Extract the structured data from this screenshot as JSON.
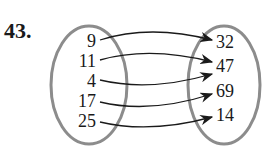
{
  "problem_number": "43.",
  "domain_set": [
    "9",
    "11",
    "4",
    "17",
    "25"
  ],
  "range_set": [
    "32",
    "47",
    "69",
    "14"
  ],
  "mappings": [
    {
      "from": "9",
      "to": "32"
    },
    {
      "from": "11",
      "to": "47"
    },
    {
      "from": "4",
      "to": "47"
    },
    {
      "from": "17",
      "to": "69"
    },
    {
      "from": "25",
      "to": "14"
    }
  ],
  "colors": {
    "oval": "#8c8c8c",
    "text": "#1a1a1a",
    "arrow": "#1a1a1a"
  }
}
